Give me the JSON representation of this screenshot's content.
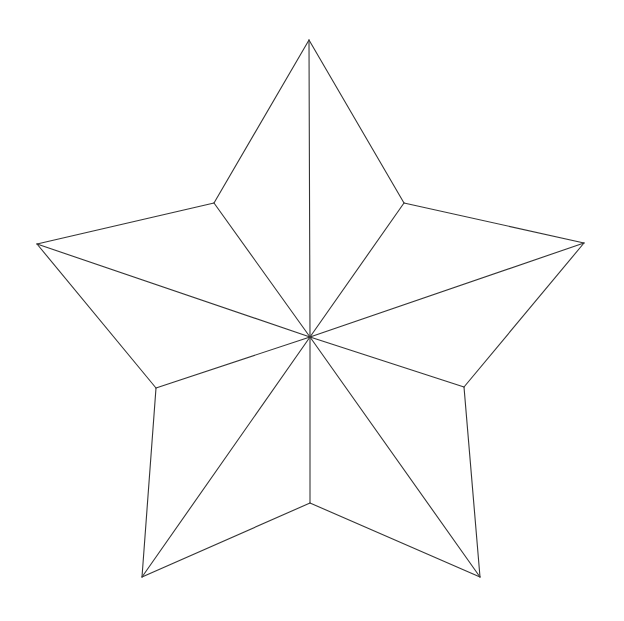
{
  "diagram": {
    "type": "five-pointed-star-wireframe",
    "background": "#ffffff",
    "stroke_color": "#333333",
    "center": {
      "x": 310,
      "y": 337
    },
    "outer_points": [
      {
        "name": "top",
        "x": 309,
        "y": 40
      },
      {
        "name": "right",
        "x": 584,
        "y": 243
      },
      {
        "name": "bottom-right",
        "x": 480,
        "y": 577
      },
      {
        "name": "bottom-left",
        "x": 142,
        "y": 577
      },
      {
        "name": "left",
        "x": 37,
        "y": 244
      }
    ],
    "inner_points": [
      {
        "name": "upper-right",
        "x": 404,
        "y": 203
      },
      {
        "name": "lower-right",
        "x": 464,
        "y": 387
      },
      {
        "name": "bottom",
        "x": 310,
        "y": 503
      },
      {
        "name": "lower-left",
        "x": 156,
        "y": 388
      },
      {
        "name": "upper-left",
        "x": 214,
        "y": 203
      }
    ]
  }
}
